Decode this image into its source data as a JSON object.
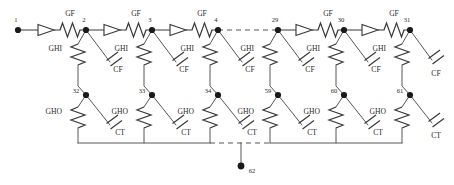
{
  "diagram": {
    "type": "electrical-schematic",
    "canvas": {
      "width": 454,
      "height": 185
    },
    "colors": {
      "wire": "#3b3b3b",
      "node": "#1a1a1a",
      "text": "#2b2b2b",
      "background": "#ffffff"
    },
    "component_labels": {
      "series_conductance": "GF",
      "shunt_upper_conductance": "GHI",
      "shunt_lower_conductance": "GHO",
      "shunt_upper_capacitance": "CF",
      "shunt_lower_capacitance": "CT"
    },
    "top_nodes": [
      {
        "id": "n1",
        "label": "1",
        "x": 18,
        "y": 30
      },
      {
        "id": "n2",
        "label": "2",
        "x": 86,
        "y": 30
      },
      {
        "id": "n3",
        "label": "3",
        "x": 152,
        "y": 30
      },
      {
        "id": "n4",
        "label": "4",
        "x": 218,
        "y": 30
      },
      {
        "id": "n29",
        "label": "29",
        "x": 278,
        "y": 30
      },
      {
        "id": "n30",
        "label": "30",
        "x": 344,
        "y": 30
      },
      {
        "id": "n31",
        "label": "31",
        "x": 410,
        "y": 30
      }
    ],
    "mid_nodes": [
      {
        "id": "n32",
        "label": "32",
        "x": 86,
        "y": 95
      },
      {
        "id": "n33",
        "label": "33",
        "x": 152,
        "y": 95
      },
      {
        "id": "n34",
        "label": "34",
        "x": 218,
        "y": 95
      },
      {
        "id": "n59",
        "label": "59",
        "x": 278,
        "y": 95
      },
      {
        "id": "n60",
        "label": "60",
        "x": 344,
        "y": 95
      },
      {
        "id": "n61",
        "label": "61",
        "x": 410,
        "y": 95
      }
    ],
    "ground_node": {
      "id": "n62",
      "label": "62",
      "x": 241,
      "y": 166
    },
    "series_branches": [
      {
        "from": "1",
        "to": "2",
        "label": "GF"
      },
      {
        "from": "2",
        "to": "3",
        "label": "GF"
      },
      {
        "from": "3",
        "to": "4",
        "label": "GF"
      },
      {
        "from": "29",
        "to": "30",
        "label": "GF"
      },
      {
        "from": "30",
        "to": "31",
        "label": "GF"
      }
    ],
    "upper_shunts": [
      {
        "node": "2",
        "resistor": "GHI",
        "capacitor": "CF"
      },
      {
        "node": "3",
        "resistor": "GHI",
        "capacitor": "CF"
      },
      {
        "node": "4",
        "resistor": "GHI",
        "capacitor": "CF"
      },
      {
        "node": "29",
        "resistor": "GHI",
        "capacitor": "CF"
      },
      {
        "node": "30",
        "resistor": "GHI",
        "capacitor": "CF"
      },
      {
        "node": "31",
        "resistor": "GHI",
        "capacitor": "CF"
      }
    ],
    "lower_shunts": [
      {
        "node": "32",
        "resistor": "GHO",
        "capacitor": "CT"
      },
      {
        "node": "33",
        "resistor": "GHO",
        "capacitor": "CT"
      },
      {
        "node": "34",
        "resistor": "GHO",
        "capacitor": "CT"
      },
      {
        "node": "59",
        "resistor": "GHO",
        "capacitor": "CT"
      },
      {
        "node": "60",
        "resistor": "GHO",
        "capacitor": "CT"
      },
      {
        "node": "61",
        "resistor": "GHO",
        "capacitor": "CT"
      }
    ],
    "ellipsis_gaps": [
      {
        "location": "top-rail",
        "between": [
          "4",
          "29"
        ]
      },
      {
        "location": "bottom-rail",
        "between": [
          "34",
          "59"
        ]
      }
    ]
  }
}
